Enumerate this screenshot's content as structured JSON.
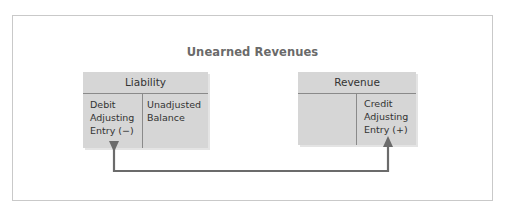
{
  "diagram": {
    "title": "Unearned Revenues",
    "accounts": [
      {
        "name": "Liability",
        "left": {
          "line1": "Debit",
          "line2": "Adjusting",
          "line3": "Entry (−)"
        },
        "right": {
          "line1": "Unadjusted",
          "line2": "Balance"
        }
      },
      {
        "name": "Revenue",
        "left": {},
        "right": {
          "line1": "Credit",
          "line2": "Adjusting",
          "line3": "Entry (+)"
        }
      }
    ],
    "connector": {
      "from": "Liability debit adjusting entry",
      "to": "Revenue credit adjusting entry",
      "color": "#6b6b6b"
    },
    "colors": {
      "account_fill": "#d6d6d6",
      "frame_border": "#c9c9c9",
      "title": "#6a6a6a"
    }
  }
}
